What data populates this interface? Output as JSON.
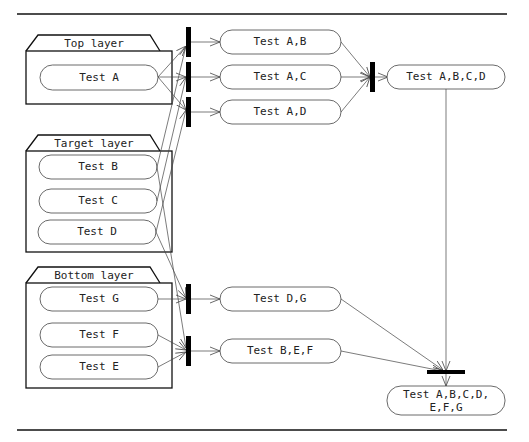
{
  "layers": [
    {
      "id": "top",
      "label": "Top layer",
      "tests": [
        "Test A"
      ]
    },
    {
      "id": "target",
      "label": "Target layer",
      "tests": [
        "Test B",
        "Test C",
        "Test D"
      ]
    },
    {
      "id": "bottom",
      "label": "Bottom layer",
      "tests": [
        "Test G",
        "Test F",
        "Test E"
      ]
    }
  ],
  "combined": {
    "ab": "Test A,B",
    "ac": "Test A,C",
    "ad": "Test A,D",
    "abcd": "Test A,B,C,D",
    "dg": "Test D,G",
    "bef": "Test B,E,F",
    "all_line1": "Test A,B,C,D,",
    "all_line2": "E,F,G"
  }
}
